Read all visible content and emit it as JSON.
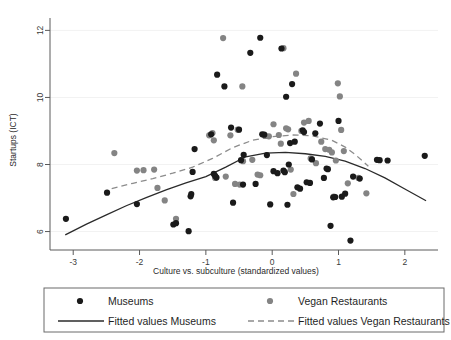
{
  "chart_data": {
    "type": "scatter",
    "title": "",
    "xlabel": "Culture vs. subculture (standardized values)",
    "ylabel": "Startups (ICT)",
    "xlim": [
      -3.35,
      2.5
    ],
    "ylim": [
      5.45,
      12.25
    ],
    "xticks": [
      -3,
      -2,
      -1,
      0,
      1,
      2
    ],
    "yticks": [
      6,
      8,
      10,
      12
    ],
    "xtick_labels": [
      "-3",
      "-2",
      "-1",
      "0",
      "1",
      "2"
    ],
    "ytick_labels": [
      "6",
      "8",
      "10",
      "12"
    ],
    "grid": "horizontal-faint",
    "legend_position": "below-plot",
    "colors": {
      "museums": "#1a1a1a",
      "vegan": "#848484",
      "fit_museums": "#2b2b2b",
      "fit_vegan": "#8c8c8c",
      "axis": "#5a5a5a",
      "grid": "#f2f2f2",
      "background": "#ffffff"
    },
    "series": [
      {
        "name": "Museums",
        "marker": "filled-circle",
        "color": "#1a1a1a",
        "points": [
          [
            -3.11,
            6.38
          ],
          [
            -2.49,
            7.16
          ],
          [
            -2.04,
            6.82
          ],
          [
            -1.49,
            6.21
          ],
          [
            -1.45,
            6.25
          ],
          [
            -1.26,
            6.01
          ],
          [
            -1.23,
            7.05
          ],
          [
            -1.22,
            7.12
          ],
          [
            -1.2,
            7.78
          ],
          [
            -1.17,
            8.46
          ],
          [
            -0.92,
            8.9
          ],
          [
            -0.88,
            7.72
          ],
          [
            -0.86,
            7.66
          ],
          [
            -0.84,
            7.61
          ],
          [
            -0.83,
            10.68
          ],
          [
            -0.72,
            10.33
          ],
          [
            -0.62,
            9.1
          ],
          [
            -0.59,
            6.86
          ],
          [
            -0.5,
            9.04
          ],
          [
            -0.47,
            8.13
          ],
          [
            -0.44,
            7.4
          ],
          [
            -0.43,
            8.29
          ],
          [
            -0.33,
            11.33
          ],
          [
            -0.25,
            7.42
          ],
          [
            -0.18,
            11.78
          ],
          [
            -0.15,
            8.9
          ],
          [
            -0.12,
            8.89
          ],
          [
            -0.08,
            8.28
          ],
          [
            -0.03,
            6.81
          ],
          [
            0.02,
            7.8
          ],
          [
            0.08,
            7.74
          ],
          [
            0.14,
            11.46
          ],
          [
            0.17,
            7.82
          ],
          [
            0.19,
            7.77
          ],
          [
            0.21,
            10.02
          ],
          [
            0.23,
            6.8
          ],
          [
            0.25,
            8.0
          ],
          [
            0.27,
            8.64
          ],
          [
            0.3,
            10.4
          ],
          [
            0.34,
            8.68
          ],
          [
            0.38,
            7.32
          ],
          [
            0.42,
            7.28
          ],
          [
            0.46,
            9.02
          ],
          [
            0.48,
            8.97
          ],
          [
            0.52,
            7.47
          ],
          [
            0.57,
            7.45
          ],
          [
            0.6,
            8.15
          ],
          [
            0.65,
            8.93
          ],
          [
            0.72,
            9.22
          ],
          [
            0.78,
            7.6
          ],
          [
            0.82,
            7.88
          ],
          [
            0.84,
            7.86
          ],
          [
            0.88,
            6.17
          ],
          [
            0.92,
            7.02
          ],
          [
            0.95,
            7.03
          ],
          [
            1.0,
            9.3
          ],
          [
            1.05,
            7.04
          ],
          [
            1.1,
            7.13
          ],
          [
            1.18,
            5.73
          ],
          [
            1.22,
            7.64
          ],
          [
            1.32,
            7.58
          ],
          [
            1.58,
            8.14
          ],
          [
            1.62,
            8.13
          ],
          [
            1.74,
            8.12
          ],
          [
            2.3,
            8.26
          ]
        ]
      },
      {
        "name": "Vegan Restaurants",
        "marker": "filled-circle",
        "color": "#848484",
        "points": [
          [
            -2.38,
            8.34
          ],
          [
            -2.04,
            7.82
          ],
          [
            -1.94,
            7.83
          ],
          [
            -1.78,
            7.85
          ],
          [
            -1.73,
            7.3
          ],
          [
            -1.62,
            6.93
          ],
          [
            -1.45,
            6.38
          ],
          [
            -0.95,
            8.87
          ],
          [
            -0.9,
            8.94
          ],
          [
            -0.88,
            8.72
          ],
          [
            -0.86,
            7.6
          ],
          [
            -0.74,
            11.77
          ],
          [
            -0.7,
            7.64
          ],
          [
            -0.63,
            8.87
          ],
          [
            -0.56,
            7.42
          ],
          [
            -0.52,
            9.04
          ],
          [
            -0.49,
            7.4
          ],
          [
            -0.45,
            10.33
          ],
          [
            -0.44,
            8.1
          ],
          [
            -0.3,
            8.14
          ],
          [
            -0.22,
            7.7
          ],
          [
            -0.18,
            7.68
          ],
          [
            -0.1,
            8.85
          ],
          [
            -0.05,
            8.84
          ],
          [
            0.02,
            9.2
          ],
          [
            0.1,
            8.88
          ],
          [
            0.13,
            8.62
          ],
          [
            0.17,
            11.47
          ],
          [
            0.21,
            9.08
          ],
          [
            0.24,
            9.05
          ],
          [
            0.28,
            7.85
          ],
          [
            0.32,
            7.12
          ],
          [
            0.36,
            10.71
          ],
          [
            0.44,
            9.0
          ],
          [
            0.48,
            9.25
          ],
          [
            0.55,
            9.3
          ],
          [
            0.58,
            8.18
          ],
          [
            0.66,
            8.04
          ],
          [
            0.74,
            8.68
          ],
          [
            0.8,
            8.46
          ],
          [
            0.86,
            8.44
          ],
          [
            0.9,
            8.36
          ],
          [
            0.93,
            7.04
          ],
          [
            0.96,
            8.12
          ],
          [
            0.99,
            10.42
          ],
          [
            1.02,
            10.03
          ],
          [
            1.04,
            9.03
          ],
          [
            1.08,
            8.4
          ],
          [
            1.14,
            7.44
          ],
          [
            1.3,
            7.6
          ],
          [
            1.42,
            7.14
          ]
        ]
      }
    ],
    "fits": [
      {
        "name": "Fitted values Museums",
        "style": "solid",
        "color": "#2b2b2b",
        "model": "quadratic",
        "xrange": [
          -3.12,
          2.32
        ],
        "curve": [
          [
            -3.12,
            5.9
          ],
          [
            -2.8,
            6.22
          ],
          [
            -2.5,
            6.5
          ],
          [
            -2.2,
            6.77
          ],
          [
            -1.9,
            7.01
          ],
          [
            -1.6,
            7.24
          ],
          [
            -1.3,
            7.45
          ],
          [
            -1.0,
            7.64
          ],
          [
            -0.7,
            7.92
          ],
          [
            -0.4,
            8.23
          ],
          [
            -0.1,
            8.34
          ],
          [
            0.2,
            8.36
          ],
          [
            0.5,
            8.32
          ],
          [
            0.8,
            8.24
          ],
          [
            1.1,
            8.1
          ],
          [
            1.4,
            7.88
          ],
          [
            1.7,
            7.6
          ],
          [
            2.0,
            7.27
          ],
          [
            2.32,
            6.92
          ]
        ]
      },
      {
        "name": "Fitted values Vegan Restaurants",
        "style": "dashed",
        "color": "#8c8c8c",
        "model": "quadratic",
        "xrange": [
          -2.42,
          1.45
        ],
        "curve": [
          [
            -2.42,
            7.28
          ],
          [
            -2.1,
            7.44
          ],
          [
            -1.8,
            7.58
          ],
          [
            -1.5,
            7.74
          ],
          [
            -1.2,
            7.92
          ],
          [
            -0.9,
            8.18
          ],
          [
            -0.6,
            8.5
          ],
          [
            -0.3,
            8.72
          ],
          [
            0.0,
            8.83
          ],
          [
            0.3,
            8.88
          ],
          [
            0.6,
            8.86
          ],
          [
            0.9,
            8.72
          ],
          [
            1.1,
            8.52
          ],
          [
            1.25,
            8.3
          ],
          [
            1.45,
            7.95
          ]
        ]
      }
    ],
    "legend_entries": [
      {
        "label": "Museums",
        "type": "marker",
        "color": "#1a1a1a"
      },
      {
        "label": "Vegan Restaurants",
        "type": "marker",
        "color": "#848484"
      },
      {
        "label": "Fitted values Museums",
        "type": "line-solid",
        "color": "#2b2b2b"
      },
      {
        "label": "Fitted values Vegan Restaurants",
        "type": "line-dashed",
        "color": "#8c8c8c"
      }
    ]
  }
}
